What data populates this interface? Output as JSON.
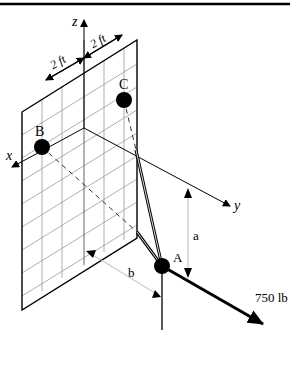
{
  "diagram": {
    "type": "3D statics free-body diagram",
    "axes": {
      "x": "x",
      "y": "y",
      "z": "z"
    },
    "dimensions": {
      "grid_spacing_left": "2 ft",
      "grid_spacing_right": "2 ft",
      "vertical_dim": "a",
      "horizontal_dim": "b"
    },
    "points": {
      "A": "A",
      "B": "B",
      "C": "C"
    },
    "force": {
      "label": "750 lb"
    },
    "colors": {
      "line": "#000000",
      "grid": "#9a9a9a",
      "dim": "#bdbdbd",
      "background": "#ffffff"
    }
  }
}
